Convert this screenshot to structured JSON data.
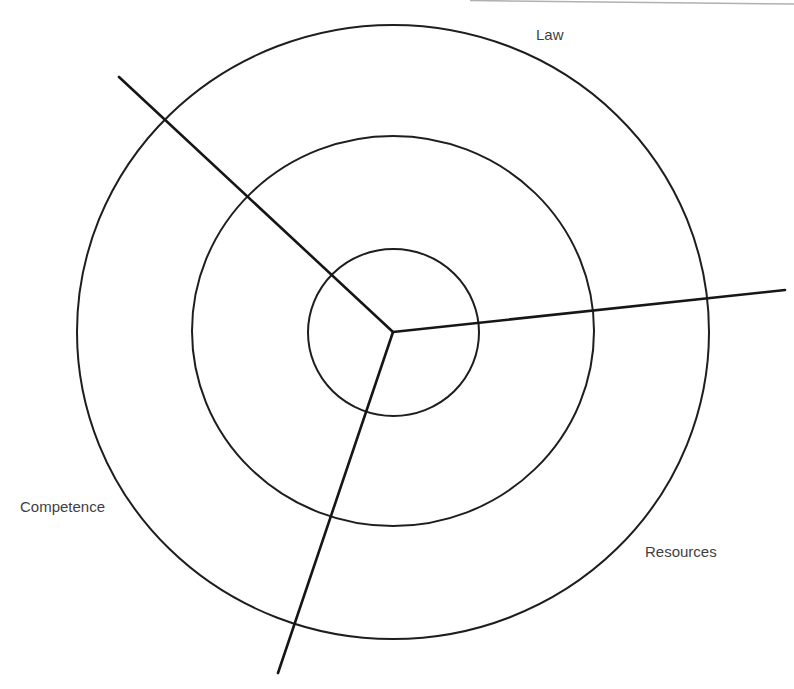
{
  "diagram": {
    "type": "concentric-rings-with-three-sectors",
    "center": {
      "x": 393,
      "y": 332
    },
    "rings": [
      {
        "name": "inner",
        "rx": 85,
        "ry": 84
      },
      {
        "name": "middle",
        "rx": 201,
        "ry": 195
      },
      {
        "name": "outer",
        "rx": 316,
        "ry": 307
      }
    ],
    "spokes": [
      {
        "name": "upper-left",
        "end": {
          "x": 119,
          "y": 77
        }
      },
      {
        "name": "right",
        "end": {
          "x": 785,
          "y": 290
        }
      },
      {
        "name": "bottom",
        "end": {
          "x": 278,
          "y": 673
        }
      }
    ],
    "labels": {
      "top": "Law",
      "left": "Competence",
      "right": "Resources"
    },
    "colors": {
      "line": "#161616",
      "text": "#3f3f3f",
      "background": "#ffffff"
    }
  }
}
